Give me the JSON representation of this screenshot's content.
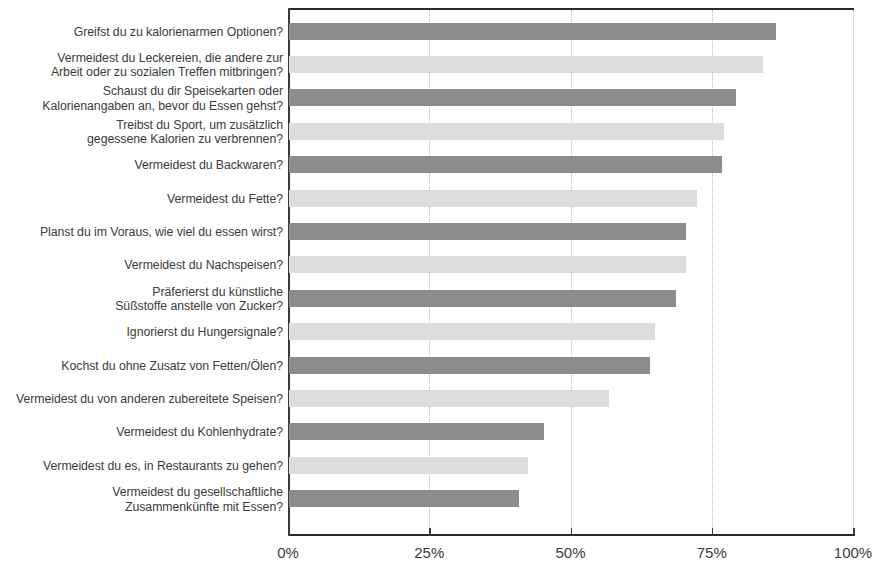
{
  "chart_data": {
    "type": "bar",
    "orientation": "horizontal",
    "title": "",
    "subtitle": "",
    "xlabel": "",
    "ylabel": "",
    "xlim": [
      0,
      100
    ],
    "xtick_labels": [
      "0%",
      "25%",
      "50%",
      "75%",
      "100%"
    ],
    "xtick_values": [
      0,
      25,
      50,
      75,
      100
    ],
    "grid": true,
    "grid_axis": "x",
    "legend": false,
    "legend_position": "none",
    "colors": {
      "bar_dark": "#8c8c8c",
      "bar_light": "#dcdcdc",
      "axis": "#2b2b2b",
      "gridline": "#b9b9b9",
      "text": "#3b3b3b",
      "background": "#ffffff"
    },
    "categories": [
      "Greifst du zu kalorienarmen Optionen?",
      "Vermeidest du Leckereien, die andere zur\nArbeit oder zu sozialen Treffen mitbringen?",
      "Schaust du dir Speisekarten oder\nKalorienangaben an, bevor du Essen gehst?",
      "Treibst du Sport, um zusätzlich\ngegessene Kalorien zu verbrennen?",
      "Vermeidest du Backwaren?",
      "Vermeidest du Fette?",
      "Planst du im Voraus, wie viel du essen wirst?",
      "Vermeidest du Nachspeisen?",
      "Präferierst du künstliche\nSüßstoffe anstelle von Zucker?",
      "Ignorierst du Hungersignale?",
      "Kochst du ohne Zusatz von Fetten/Ölen?",
      "Vermeidest du von anderen zubereitete Speisen?",
      "Vermeidest du Kohlenhydrate?",
      "Vermeidest du es, in Restaurants zu gehen?",
      "Vermeidest du gesellschaftliche\nZusammenkünfte mit Essen?"
    ],
    "values": [
      86.4,
      84.1,
      79.3,
      77.2,
      76.8,
      72.4,
      70.4,
      70.4,
      68.7,
      65.0,
      64.0,
      56.8,
      45.3,
      42.5,
      40.9
    ],
    "bar_shades": [
      "dark",
      "light",
      "dark",
      "light",
      "dark",
      "light",
      "dark",
      "light",
      "dark",
      "light",
      "dark",
      "light",
      "dark",
      "light",
      "dark"
    ]
  }
}
